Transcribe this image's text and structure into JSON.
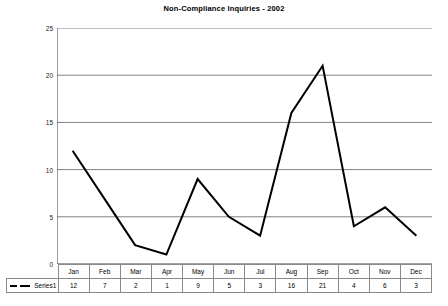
{
  "chart_data": {
    "type": "line",
    "title": "Non-Compliance Inquiries - 2002",
    "xlabel": "",
    "ylabel": "",
    "ylim": [
      0,
      25
    ],
    "yticks": [
      0,
      5,
      10,
      15,
      20,
      25
    ],
    "grid": true,
    "legend_position": "table-left",
    "categories": [
      "Jan",
      "Feb",
      "Mar",
      "Apr",
      "May",
      "Jun",
      "Jul",
      "Aug",
      "Sep",
      "Oct",
      "Nov",
      "Dec"
    ],
    "series": [
      {
        "name": "Series1",
        "values": [
          12,
          7,
          2,
          1,
          9,
          5,
          3,
          16,
          21,
          4,
          6,
          3
        ],
        "color": "#000000",
        "line_width": 2
      }
    ]
  },
  "axis": {
    "y_tick_labels": [
      "25",
      "20",
      "15",
      "10",
      "5",
      "0"
    ]
  },
  "table": {
    "legend_label": "Series1",
    "headers": [
      "Jan",
      "Feb",
      "Mar",
      "Apr",
      "May",
      "Jun",
      "Jul",
      "Aug",
      "Sep",
      "Oct",
      "Nov",
      "Dec"
    ],
    "values": [
      "12",
      "7",
      "2",
      "1",
      "9",
      "5",
      "3",
      "16",
      "21",
      "4",
      "6",
      "3"
    ]
  },
  "colors": {
    "series": "#000000",
    "gridline": "#808080",
    "axis": "#404040",
    "table_border": "#8a8a8a",
    "background": "#ffffff"
  }
}
